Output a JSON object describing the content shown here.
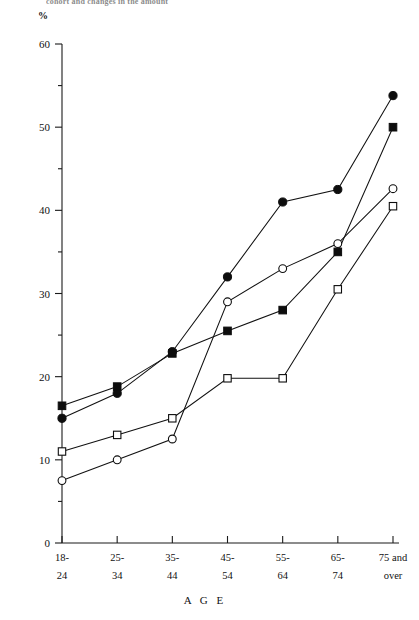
{
  "figure": {
    "top_caption_fragment": "cohort and changes in the amount",
    "percent_symbol": "%",
    "axis_title_x": "A G E"
  },
  "chart_data": {
    "type": "line",
    "title": "",
    "subtitle": "",
    "xlabel": "A G E",
    "ylabel": "%",
    "ylim": [
      0,
      60
    ],
    "xlim_categories": 7,
    "grid": false,
    "legend_position": "none",
    "ytick_labels": [
      "0",
      "10",
      "20",
      "30",
      "40",
      "50",
      "60"
    ],
    "ytick_values": [
      0,
      10,
      20,
      30,
      40,
      50,
      60
    ],
    "yminor_step": 5,
    "categories": [
      "18-\n24",
      "25-\n34",
      "35-\n44",
      "45-\n54",
      "55-\n64",
      "65-\n74",
      "75 and\nover"
    ],
    "category_lines": [
      [
        "18-",
        "24"
      ],
      [
        "25-",
        "34"
      ],
      [
        "35-",
        "44"
      ],
      [
        "45-",
        "54"
      ],
      [
        "55-",
        "64"
      ],
      [
        "65-",
        "74"
      ],
      [
        "75 and",
        "over"
      ]
    ],
    "series": [
      {
        "name": "filled-circle",
        "marker": "filled circle",
        "color": "#0d0d0d",
        "values": [
          15.0,
          18.0,
          23.0,
          32.0,
          41.0,
          42.5,
          53.8
        ]
      },
      {
        "name": "filled-square",
        "marker": "filled square",
        "color": "#0d0d0d",
        "values": [
          16.5,
          18.8,
          22.8,
          25.5,
          28.0,
          35.0,
          50.0
        ]
      },
      {
        "name": "open-circle",
        "marker": "open circle",
        "color": "#0d0d0d",
        "values": [
          7.5,
          10.0,
          12.5,
          29.0,
          33.0,
          36.0,
          42.6
        ]
      },
      {
        "name": "open-square",
        "marker": "open square",
        "color": "#0d0d0d",
        "values": [
          11.0,
          13.0,
          15.0,
          19.8,
          19.8,
          30.5,
          40.5
        ]
      }
    ]
  }
}
